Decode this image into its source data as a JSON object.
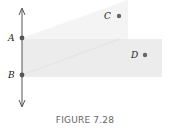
{
  "figure": {
    "caption": "FIGURE 7.28",
    "line": {
      "x": 22,
      "y_top": 8,
      "y_bottom": 107
    },
    "points": [
      {
        "id": "A",
        "label": "A",
        "x": 22,
        "y": 38,
        "on_line": true
      },
      {
        "id": "B",
        "label": "B",
        "x": 22,
        "y": 75,
        "on_line": true
      },
      {
        "id": "C",
        "label": "C",
        "x": 119,
        "y": 16,
        "on_line": false
      },
      {
        "id": "D",
        "label": "D",
        "x": 145,
        "y": 55,
        "on_line": false
      }
    ],
    "regions": [
      {
        "name": "upper-wedge",
        "description": "half-plane region above A bounded by ray from A",
        "color": "#f3f3f3"
      },
      {
        "name": "lower-band",
        "description": "band between A and B extending right",
        "color": "#eeeeee"
      }
    ],
    "colors": {
      "line": "#555555",
      "point": "#555555",
      "shade_upper": "#f4f4f4",
      "shade_lower": "#ececec"
    }
  }
}
